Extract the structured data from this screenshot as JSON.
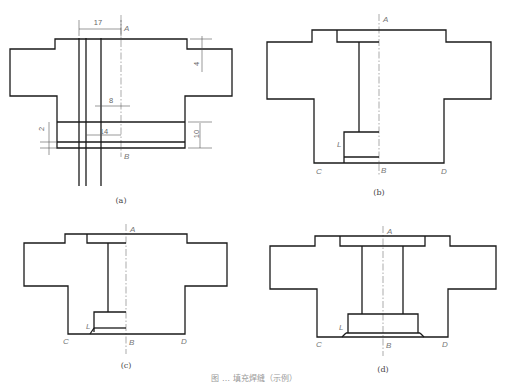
{
  "figure": {
    "caption_partial": "图 … 填充焊缝（示例）",
    "panels": [
      {
        "id": "a",
        "caption": "(a)",
        "caption_pos": [
          121,
          203
        ],
        "outline": "M10,49 L55,49 L55,39 L187,39 L187,49 L232,49 L232,96 L185,96 L185,148 L57,148 L57,96 L10,96 Z",
        "inner_lines": [
          "M57,122 L185,122",
          "M57,142 L185,142",
          "M79,38 L79,186",
          "M86,38 L86,186",
          "M101,38 L101,186"
        ],
        "centerline": {
          "x": 121,
          "y1": 15,
          "y2": 157
        },
        "labels": [
          {
            "text": "A",
            "x": 124,
            "y": 31
          },
          {
            "text": "B",
            "x": 124,
            "y": 159
          }
        ],
        "dimensions": [
          {
            "text": "17",
            "x": 98,
            "y": 25,
            "line": "M79,29 L121,29",
            "ext": [
              "M79,20 L79,36",
              "M121,20 L121,36"
            ]
          },
          {
            "text": "4",
            "x": 199,
            "y": 64,
            "line": "M202,36 L202,72",
            "ext": [
              "M190,39 L212,39",
              "M190,49 L212,49"
            ],
            "rotate": -90
          },
          {
            "text": "8",
            "x": 111,
            "y": 103,
            "line": "M95,106 L130,106",
            "ext": []
          },
          {
            "text": "14",
            "x": 104,
            "y": 134,
            "line": "M86,135 L121,135",
            "ext": []
          },
          {
            "text": "10",
            "x": 199,
            "y": 134,
            "line": "M200,123 L200,148",
            "ext": [
              "M188,122 L212,122",
              "M188,148 L212,148"
            ],
            "rotate": -90
          },
          {
            "text": "2",
            "x": 44,
            "y": 129,
            "line": "M49,122 L49,155",
            "ext": [
              "M40,142 L57,142",
              "M40,148 L57,148"
            ],
            "rotate": -90
          }
        ]
      },
      {
        "id": "b",
        "caption": "(b)",
        "caption_pos": [
          379,
          195
        ],
        "outline": "M267,42 L312,42 L312,30 L446,30 L446,42 L491,42 L491,99 L444,99 L444,163 L314,163 L314,99 L267,99 Z",
        "inner_lines": [
          "M337,30 L337,42 L379,42",
          "M359,42 L359,132",
          "M344,163 L344,132 L379,132",
          "M344,157 L379,157"
        ],
        "centerline": {
          "x": 379,
          "y1": 14,
          "y2": 176
        },
        "labels": [
          {
            "text": "A",
            "x": 383,
            "y": 22
          },
          {
            "text": "B",
            "x": 381,
            "y": 173
          },
          {
            "text": "C",
            "x": 316,
            "y": 174
          },
          {
            "text": "D",
            "x": 441,
            "y": 174
          },
          {
            "text": "L",
            "x": 337,
            "y": 147
          }
        ],
        "dimensions": []
      },
      {
        "id": "c",
        "caption": "(c)",
        "caption_pos": [
          126,
          368
        ],
        "outline": "M24,243 L65,243 L65,234 L187,234 L187,243 L227,243 L227,286 L185,286 L185,334 L68,334 L68,286 L24,286 Z",
        "inner_lines": [
          "M87,234 L87,243 L126,243",
          "M108,243 L108,312",
          "M94,332 L94,312 L126,312",
          "M94,328 L126,328",
          "M90,334 L94,328"
        ],
        "centerline": {
          "x": 126,
          "y1": 224,
          "y2": 354
        },
        "labels": [
          {
            "text": "A",
            "x": 130,
            "y": 232
          },
          {
            "text": "B",
            "x": 129,
            "y": 345
          },
          {
            "text": "C",
            "x": 63,
            "y": 344
          },
          {
            "text": "D",
            "x": 181,
            "y": 344
          },
          {
            "text": "L",
            "x": 86,
            "y": 329
          }
        ],
        "dimensions": []
      },
      {
        "id": "d",
        "caption": "(d)",
        "caption_pos": [
          383,
          372
        ],
        "outline": "M270,246 L315,246 L315,236 L450,236 L450,246 L496,246 L496,289 L448,289 L448,337 L317,337 L317,289 L270,289 Z",
        "inner_lines": [
          "M340,236 L340,246 L425,246 L425,236",
          "M362,246 L362,314",
          "M403,246 L403,314",
          "M348,333 L348,314 L418,314 L418,333",
          "M346,333 L420,333",
          "M342,337 L346,333",
          "M420,333 L424,337"
        ],
        "centerline": {
          "x": 383,
          "y1": 226,
          "y2": 356
        },
        "labels": [
          {
            "text": "A",
            "x": 387,
            "y": 234
          },
          {
            "text": "B",
            "x": 386,
            "y": 348
          },
          {
            "text": "C",
            "x": 316,
            "y": 347
          },
          {
            "text": "D",
            "x": 442,
            "y": 347
          },
          {
            "text": "L",
            "x": 339,
            "y": 330
          }
        ],
        "dimensions": []
      }
    ]
  }
}
